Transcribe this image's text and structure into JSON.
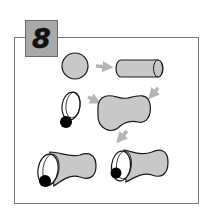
{
  "step": {
    "number": "8",
    "badge_color": "#a9a9a9",
    "frame_color": "#7a7a7a"
  },
  "diagram": {
    "shapes": [
      {
        "name": "circle",
        "fill": "#c8c8c8"
      },
      {
        "name": "cylinder",
        "fill": "#c8c8c8"
      },
      {
        "name": "eye",
        "fill": "#ffffff",
        "pupil": "#000000"
      },
      {
        "name": "peanut-body",
        "fill": "#c8c8c8"
      },
      {
        "name": "assembled-figure-left"
      },
      {
        "name": "assembled-figure-right"
      }
    ],
    "arrow_color": "#b5b5b5",
    "shape_fill": "#c8c8c8",
    "outline_color": "#1a1a1a"
  }
}
